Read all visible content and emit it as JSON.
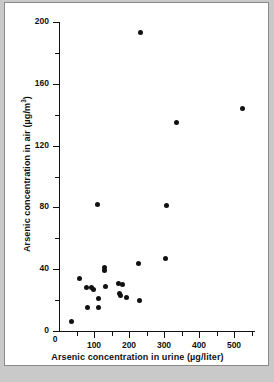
{
  "figure": {
    "background_color": "#ffffff",
    "page_color": "#c9c9c9",
    "marker_color": "#111111"
  },
  "chart_data": {
    "type": "scatter",
    "title": "",
    "xlabel": "Arsenic concentration in urine (µg/liter)",
    "ylabel": "Arsenic concentration in air (µg/m³)",
    "ylabel_main": "Arsenic concentration in air (µg/m",
    "ylabel_sup": "3",
    "ylabel_close": ")",
    "xlim": [
      0,
      560
    ],
    "ylim": [
      0,
      200
    ],
    "grid": false,
    "legend": null,
    "xticks": [
      0,
      100,
      200,
      300,
      400,
      500
    ],
    "xtick_labels": [
      "0",
      "100",
      "200",
      "300",
      "400",
      "500"
    ],
    "xticks_minor": [
      50,
      150,
      250,
      350,
      450,
      550
    ],
    "yticks": [
      0,
      40,
      80,
      120,
      160,
      200
    ],
    "ytick_labels": [
      "0",
      "40",
      "80",
      "120",
      "160",
      "200"
    ],
    "yticks_minor": [
      20,
      60,
      100,
      140,
      180
    ],
    "series": [
      {
        "name": "subjects",
        "points": [
          [
            35,
            6
          ],
          [
            58,
            34
          ],
          [
            78,
            28
          ],
          [
            80,
            15
          ],
          [
            93,
            28
          ],
          [
            98,
            27
          ],
          [
            110,
            82
          ],
          [
            112,
            21
          ],
          [
            113,
            15
          ],
          [
            130,
            41
          ],
          [
            131,
            39
          ],
          [
            133,
            29
          ],
          [
            170,
            31
          ],
          [
            172,
            24
          ],
          [
            175,
            23
          ],
          [
            180,
            30
          ],
          [
            193,
            22
          ],
          [
            228,
            44
          ],
          [
            230,
            20
          ],
          [
            232,
            193
          ],
          [
            303,
            47
          ],
          [
            307,
            81
          ],
          [
            337,
            135
          ],
          [
            523,
            144
          ]
        ]
      }
    ]
  }
}
